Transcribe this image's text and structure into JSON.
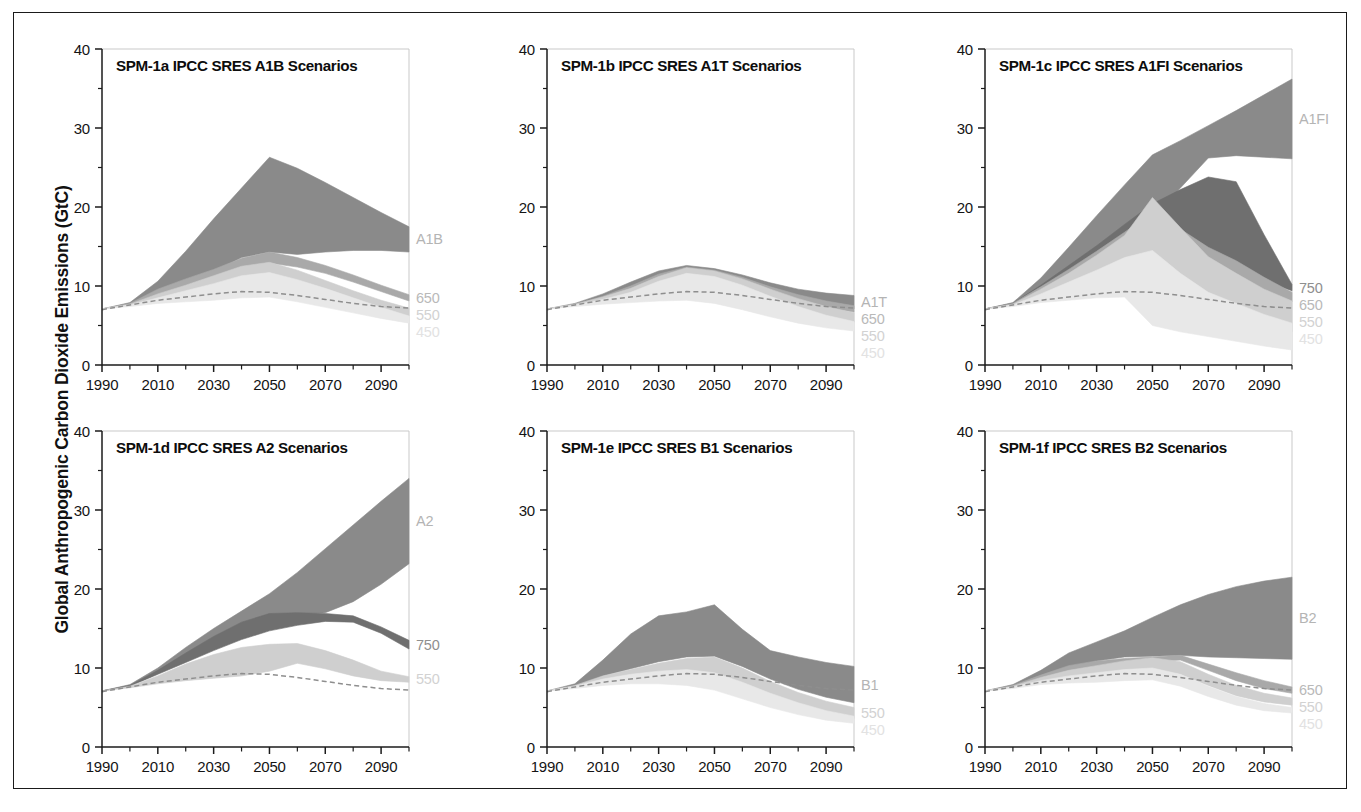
{
  "figure": {
    "y_axis_title": "Global Anthropogenic Carbon Dioxide Emissions (GtC)"
  },
  "chart_data": {
    "type": "area",
    "title": "Global Anthropogenic Carbon Dioxide Emissions (GtC)",
    "xlabel": "",
    "ylabel": "Global Anthropogenic Carbon Dioxide Emissions (GtC)",
    "xlim": [
      1990,
      2100
    ],
    "ylim": [
      0,
      40
    ],
    "xticks": [
      1990,
      2010,
      2030,
      2050,
      2070,
      2090
    ],
    "yticks": [
      0,
      10,
      20,
      30,
      40
    ],
    "xtick_labels": [
      "1990",
      "2010",
      "2030",
      "2050",
      "2070",
      "2090"
    ],
    "ytick_labels": [
      "0",
      "10",
      "20",
      "30",
      "40"
    ],
    "x_minor_step": 10,
    "y_minor_step": 5,
    "grid": false,
    "legend": "inline-right-edge",
    "x": [
      1990,
      2000,
      2010,
      2020,
      2030,
      2040,
      2050,
      2060,
      2070,
      2080,
      2090,
      2100
    ],
    "historical": {
      "name": "historical / reference dashed",
      "style": "dashed",
      "color": "#8e8e8e",
      "values": [
        7.0,
        7.6,
        8.2,
        8.6,
        9.0,
        9.3,
        9.2,
        8.8,
        8.3,
        7.8,
        7.4,
        7.2
      ]
    },
    "band_colors": {
      "scenario": "#8a8a8a",
      "750": "#6f6f6f",
      "650": "#a9a9a9",
      "550": "#cfcfcf",
      "450": "#e8e8e8"
    },
    "panels": [
      {
        "id": "spm-1a",
        "title": "SPM-1a IPCC SRES A1B Scenarios",
        "scenario": "A1B",
        "side_labels": [
          "A1B",
          "650",
          "550",
          "450"
        ],
        "bands": [
          {
            "name": "A1B",
            "color": "#8a8a8a",
            "upper": [
              7.1,
              7.9,
              10.6,
              14.4,
              18.5,
              22.4,
              26.3,
              24.9,
              23.1,
              21.2,
              19.3,
              17.5
            ],
            "lower": [
              7.1,
              7.7,
              9.3,
              10.6,
              11.8,
              13.6,
              14.3,
              14.0,
              14.3,
              14.5,
              14.5,
              14.3
            ]
          },
          {
            "name": "650",
            "color": "#a9a9a9",
            "upper": [
              7.1,
              7.8,
              9.6,
              10.9,
              12.1,
              13.5,
              14.3,
              13.6,
              12.6,
              11.4,
              10.1,
              8.9
            ],
            "lower": [
              7.1,
              7.6,
              8.7,
              9.7,
              10.8,
              12.0,
              12.9,
              12.4,
              11.6,
              10.5,
              9.3,
              8.1
            ]
          },
          {
            "name": "550",
            "color": "#cfcfcf",
            "upper": [
              7.1,
              7.7,
              9.0,
              10.1,
              11.3,
              12.5,
              13.0,
              12.0,
              10.7,
              9.4,
              8.2,
              7.2
            ],
            "lower": [
              7.1,
              7.5,
              8.2,
              8.8,
              9.4,
              10.0,
              10.3,
              9.6,
              8.7,
              7.8,
              6.9,
              6.2
            ]
          },
          {
            "name": "450",
            "color": "#e8e8e8",
            "upper": [
              7.1,
              7.6,
              8.5,
              9.4,
              10.3,
              11.3,
              11.7,
              10.8,
              9.7,
              8.5,
              7.3,
              6.2
            ],
            "lower": [
              7.1,
              7.4,
              7.8,
              8.0,
              8.2,
              8.5,
              8.6,
              8.0,
              7.3,
              6.6,
              5.9,
              5.3
            ]
          }
        ]
      },
      {
        "id": "spm-1b",
        "title": "SPM-1b IPCC SRES A1T Scenarios",
        "scenario": "A1T",
        "side_labels": [
          "A1T",
          "650",
          "550",
          "450"
        ],
        "bands": [
          {
            "name": "A1T",
            "color": "#8a8a8a",
            "upper": [
              7.1,
              7.8,
              9.0,
              10.5,
              11.9,
              12.6,
              12.2,
              11.4,
              10.4,
              9.6,
              9.1,
              8.8
            ],
            "lower": [
              7.1,
              7.6,
              8.5,
              9.2,
              10.1,
              10.8,
              11.0,
              10.4,
              9.4,
              8.4,
              7.6,
              7.1
            ]
          },
          {
            "name": "650",
            "color": "#a9a9a9",
            "upper": [
              7.1,
              7.7,
              8.7,
              10.0,
              11.5,
              12.4,
              12.0,
              11.1,
              9.9,
              8.9,
              8.1,
              7.5
            ],
            "lower": [
              7.1,
              7.6,
              8.4,
              9.1,
              9.9,
              10.6,
              10.7,
              10.1,
              9.0,
              8.0,
              7.2,
              6.7
            ]
          },
          {
            "name": "550",
            "color": "#cfcfcf",
            "upper": [
              7.1,
              7.7,
              8.6,
              9.7,
              11.2,
              12.3,
              11.9,
              10.9,
              9.6,
              8.4,
              7.4,
              6.6
            ],
            "lower": [
              7.1,
              7.5,
              8.1,
              8.6,
              9.2,
              9.6,
              9.4,
              8.6,
              7.6,
              6.6,
              5.9,
              5.4
            ]
          },
          {
            "name": "450",
            "color": "#e8e8e8",
            "upper": [
              7.1,
              7.6,
              8.3,
              9.2,
              10.6,
              11.6,
              11.2,
              10.1,
              8.7,
              7.4,
              6.3,
              5.5
            ],
            "lower": [
              7.1,
              7.4,
              7.7,
              7.9,
              8.1,
              8.2,
              7.8,
              7.0,
              6.1,
              5.3,
              4.7,
              4.3
            ]
          }
        ]
      },
      {
        "id": "spm-1c",
        "title": "SPM-1c IPCC SRES A1FI Scenarios",
        "scenario": "A1FI",
        "side_labels": [
          "A1FI",
          "750",
          "650",
          "550",
          "450"
        ],
        "bands": [
          {
            "name": "A1FI",
            "color": "#8a8a8a",
            "upper": [
              7.1,
              7.9,
              11.0,
              14.9,
              18.9,
              22.8,
              26.6,
              28.4,
              30.3,
              32.2,
              34.2,
              36.2
            ],
            "lower": [
              7.1,
              7.7,
              9.8,
              12.0,
              14.2,
              16.4,
              18.6,
              22.4,
              26.2,
              26.5,
              26.3,
              26.1
            ]
          },
          {
            "name": "750",
            "color": "#6f6f6f",
            "upper": [
              7.1,
              7.8,
              10.1,
              12.6,
              15.1,
              17.8,
              20.4,
              22.2,
              23.8,
              23.2,
              16.5,
              10.2
            ],
            "lower": [
              7.1,
              7.6,
              9.2,
              10.8,
              12.5,
              14.2,
              15.9,
              13.6,
              11.9,
              11.5,
              10.6,
              9.4
            ]
          },
          {
            "name": "650",
            "color": "#a9a9a9",
            "upper": [
              7.1,
              7.8,
              9.9,
              12.1,
              14.4,
              16.8,
              19.3,
              17.2,
              14.9,
              13.2,
              11.1,
              9.2
            ],
            "lower": [
              7.1,
              7.6,
              9.0,
              10.2,
              11.5,
              12.7,
              13.2,
              11.4,
              9.9,
              9.2,
              8.6,
              8.0
            ]
          },
          {
            "name": "550",
            "color": "#cfcfcf",
            "upper": [
              7.1,
              7.7,
              9.6,
              11.6,
              13.9,
              16.4,
              21.2,
              17.4,
              13.7,
              11.6,
              9.6,
              8.1
            ],
            "lower": [
              7.1,
              7.5,
              8.5,
              9.4,
              10.1,
              10.6,
              7.0,
              6.3,
              5.9,
              5.4,
              4.8,
              4.2
            ]
          },
          {
            "name": "450",
            "color": "#e8e8e8",
            "upper": [
              7.1,
              7.6,
              9.0,
              10.5,
              12.0,
              13.6,
              14.5,
              11.6,
              9.2,
              7.8,
              6.4,
              5.3
            ],
            "lower": [
              7.1,
              7.4,
              7.9,
              8.2,
              8.5,
              8.6,
              5.0,
              4.2,
              3.6,
              3.0,
              2.4,
              1.9
            ]
          }
        ]
      },
      {
        "id": "spm-1d",
        "title": "SPM-1d IPCC SRES A2 Scenarios",
        "scenario": "A2",
        "side_labels": [
          "A2",
          "750",
          "550"
        ],
        "bands": [
          {
            "name": "A2",
            "color": "#8a8a8a",
            "upper": [
              7.1,
              7.9,
              10.0,
              12.6,
              15.0,
              17.2,
              19.4,
              22.1,
              25.1,
              28.1,
              31.1,
              34.0
            ],
            "lower": [
              7.1,
              7.7,
              9.3,
              11.0,
              12.7,
              14.2,
              15.6,
              16.7,
              17.0,
              18.4,
              20.6,
              23.2
            ]
          },
          {
            "name": "750",
            "color": "#6f6f6f",
            "upper": [
              7.1,
              7.8,
              9.7,
              11.9,
              14.0,
              15.8,
              16.9,
              17.0,
              16.9,
              16.6,
              15.2,
              13.5
            ],
            "lower": [
              7.1,
              7.7,
              9.2,
              10.7,
              12.2,
              13.6,
              14.7,
              15.4,
              15.9,
              15.8,
              14.4,
              12.4
            ]
          },
          {
            "name": "550",
            "color": "#cfcfcf",
            "upper": [
              7.1,
              7.7,
              9.0,
              10.5,
              11.7,
              12.6,
              13.0,
              13.1,
              12.2,
              11.0,
              9.6,
              8.9
            ],
            "lower": [
              7.1,
              7.5,
              8.0,
              8.4,
              8.7,
              9.0,
              9.6,
              10.6,
              9.9,
              9.0,
              8.4,
              8.2
            ]
          }
        ]
      },
      {
        "id": "spm-1e",
        "title": "SPM-1e IPCC SRES B1 Scenarios",
        "scenario": "B1",
        "side_labels": [
          "B1",
          "550",
          "450"
        ],
        "bands": [
          {
            "name": "B1",
            "color": "#8a8a8a",
            "upper": [
              7.1,
              8.0,
              11.0,
              14.3,
              16.6,
              17.1,
              18.0,
              14.9,
              12.2,
              11.4,
              10.7,
              10.2
            ],
            "lower": [
              7.1,
              7.7,
              9.0,
              9.9,
              10.8,
              11.4,
              11.5,
              10.2,
              8.6,
              7.3,
              6.3,
              5.6
            ]
          },
          {
            "name": "550",
            "color": "#cfcfcf",
            "upper": [
              7.1,
              7.8,
              9.0,
              9.8,
              10.6,
              11.2,
              11.4,
              10.0,
              8.3,
              6.9,
              5.8,
              5.0
            ],
            "lower": [
              7.1,
              7.5,
              8.2,
              8.6,
              8.8,
              8.7,
              8.2,
              7.1,
              5.9,
              4.9,
              4.1,
              3.6
            ]
          },
          {
            "name": "450",
            "color": "#e8e8e8",
            "upper": [
              7.1,
              7.7,
              8.6,
              9.2,
              9.6,
              9.8,
              9.4,
              8.2,
              6.8,
              5.6,
              4.6,
              3.9
            ],
            "lower": [
              7.1,
              7.4,
              7.8,
              8.0,
              8.0,
              7.8,
              7.2,
              6.1,
              5.0,
              4.1,
              3.4,
              3.0
            ]
          }
        ]
      },
      {
        "id": "spm-1f",
        "title": "SPM-1f IPCC SRES B2 Scenarios",
        "scenario": "B2",
        "side_labels": [
          "B2",
          "650",
          "550",
          "450"
        ],
        "bands": [
          {
            "name": "B2",
            "color": "#8a8a8a",
            "upper": [
              7.1,
              7.9,
              9.7,
              11.9,
              13.3,
              14.7,
              16.4,
              18.0,
              19.3,
              20.3,
              21.0,
              21.5
            ],
            "lower": [
              7.1,
              7.7,
              8.9,
              10.0,
              10.9,
              11.4,
              11.5,
              11.6,
              11.4,
              11.3,
              11.2,
              11.1
            ]
          },
          {
            "name": "650",
            "color": "#a9a9a9",
            "upper": [
              7.1,
              7.8,
              9.1,
              10.3,
              10.9,
              11.2,
              11.4,
              11.6,
              10.5,
              9.4,
              8.4,
              7.6
            ],
            "lower": [
              7.1,
              7.6,
              8.6,
              9.3,
              9.8,
              10.3,
              10.8,
              11.0,
              9.7,
              8.4,
              7.4,
              6.8
            ]
          },
          {
            "name": "550",
            "color": "#cfcfcf",
            "upper": [
              7.1,
              7.7,
              8.8,
              9.7,
              10.3,
              10.9,
              11.3,
              10.8,
              9.2,
              7.8,
              6.8,
              6.2
            ],
            "lower": [
              7.1,
              7.5,
              8.3,
              8.8,
              9.1,
              9.5,
              9.8,
              9.2,
              7.8,
              6.5,
              5.7,
              5.3
            ]
          },
          {
            "name": "450",
            "color": "#e8e8e8",
            "upper": [
              7.1,
              7.6,
              8.4,
              9.0,
              9.4,
              9.8,
              10.0,
              9.2,
              7.7,
              6.4,
              5.5,
              5.0
            ],
            "lower": [
              7.1,
              7.4,
              7.9,
              8.1,
              8.2,
              8.4,
              8.5,
              7.7,
              6.4,
              5.3,
              4.6,
              4.3
            ]
          }
        ]
      }
    ]
  },
  "side_label_colors": {
    "A1B": "#b4b4b4",
    "A1T": "#b4b4b4",
    "A1FI": "#b4b4b4",
    "A2": "#b4b4b4",
    "B1": "#b4b4b4",
    "B2": "#b4b4b4",
    "750": "#8f8f8f",
    "650": "#b9b9b9",
    "550": "#d2d2d2",
    "450": "#e2e2e2"
  }
}
